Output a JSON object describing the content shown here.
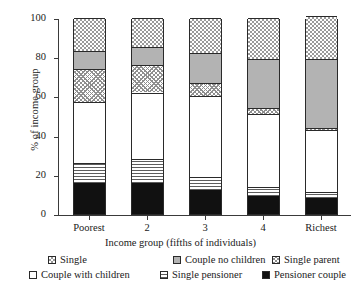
{
  "chart_data": {
    "type": "bar",
    "subtype": "stacked-percentage",
    "title": "",
    "xlabel": "Income group (fifths of individuals)",
    "ylabel": "% of income group",
    "categories": [
      "Poorest",
      "2",
      "3",
      "4",
      "Richest"
    ],
    "ylim": [
      0,
      100
    ],
    "yticks": [
      0,
      20,
      40,
      60,
      80,
      100
    ],
    "grid": false,
    "legend_position": "bottom",
    "stack_order_bottom_to_top": [
      "Pensioner couple",
      "Single pensioner",
      "Couple with children",
      "Single parent",
      "Couple no children",
      "Single"
    ],
    "series": [
      {
        "name": "Pensioner couple",
        "values": [
          16,
          16,
          12,
          9,
          8
        ]
      },
      {
        "name": "Single pensioner",
        "values": [
          10,
          12,
          7,
          5,
          3
        ]
      },
      {
        "name": "Couple with children",
        "values": [
          31,
          34,
          41,
          37,
          32
        ]
      },
      {
        "name": "Single parent",
        "values": [
          17,
          14,
          7,
          3,
          1
        ]
      },
      {
        "name": "Couple no children",
        "values": [
          9,
          9,
          15,
          25,
          35
        ]
      },
      {
        "name": "Single",
        "values": [
          17,
          15,
          18,
          21,
          22
        ]
      }
    ],
    "cumulative_tops": [
      [
        16,
        26,
        57,
        74,
        83,
        100
      ],
      [
        16,
        28,
        62,
        76,
        85,
        100
      ],
      [
        12,
        19,
        60,
        67,
        82,
        100
      ],
      [
        9,
        14,
        51,
        54,
        79,
        100
      ],
      [
        8,
        11,
        43,
        44,
        78,
        100
      ]
    ]
  },
  "axes": {
    "y_tick_labels": [
      "0",
      "20",
      "40",
      "60",
      "80",
      "100"
    ],
    "x_tick_labels": [
      "Poorest",
      "2",
      "3",
      "4",
      "Richest"
    ],
    "y_axis_title": "% of income group",
    "x_axis_title": "Income group (fifths of individuals)"
  },
  "legend": {
    "row1": [
      {
        "label": "Single",
        "pattern": "checkerboard",
        "color": "#9a9a9a"
      },
      {
        "label": "Couple no children",
        "pattern": "solid-gray",
        "color": "#b3b3b3"
      },
      {
        "label": "Single parent",
        "pattern": "cross-hatch",
        "color": "#8f8f8f"
      }
    ],
    "row2": [
      {
        "label": "Couple with children",
        "pattern": "white",
        "color": "#ffffff"
      },
      {
        "label": "Single pensioner",
        "pattern": "horizontal-lines",
        "color": "#5d5d5d"
      },
      {
        "label": "Pensioner couple",
        "pattern": "solid-black",
        "color": "#111111"
      }
    ]
  }
}
